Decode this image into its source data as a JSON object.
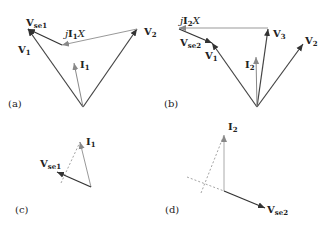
{
  "panels": {
    "a": {
      "label": "(a)",
      "vectors": {
        "V1": {
          "base": "V",
          "sub": "1"
        },
        "Vse1": {
          "base": "V",
          "sub": "se1"
        },
        "V2": {
          "base": "V",
          "sub": "2"
        },
        "I1": {
          "base": "I",
          "sub": "1"
        },
        "drop": {
          "prefix": "j",
          "base": "I",
          "sub": "1",
          "suffix": "X"
        }
      }
    },
    "b": {
      "label": "(b)",
      "vectors": {
        "V1": {
          "base": "V",
          "sub": "1"
        },
        "Vse2": {
          "base": "V",
          "sub": "se2"
        },
        "V2": {
          "base": "V",
          "sub": "2"
        },
        "V3": {
          "base": "V",
          "sub": "3"
        },
        "I2": {
          "base": "I",
          "sub": "2"
        },
        "drop": {
          "prefix": "j",
          "base": "I",
          "sub": "2",
          "suffix": "X"
        }
      }
    },
    "c": {
      "label": "(c)",
      "vectors": {
        "I1": {
          "base": "I",
          "sub": "1"
        },
        "Vse1": {
          "base": "V",
          "sub": "se1"
        }
      }
    },
    "d": {
      "label": "(d)",
      "vectors": {
        "I2": {
          "base": "I",
          "sub": "2"
        },
        "Vse2": {
          "base": "V",
          "sub": "se2"
        }
      }
    }
  },
  "colors": {
    "dark_line": "#333333",
    "light_line": "#888888",
    "text": "#222222"
  }
}
